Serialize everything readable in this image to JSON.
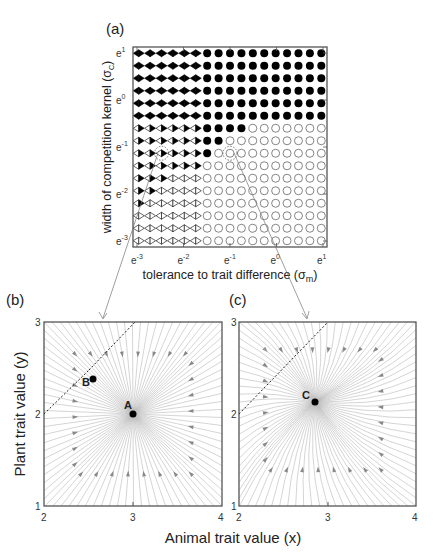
{
  "chart_data": [
    {
      "id": "a",
      "type": "scatter",
      "panel_label": "(a)",
      "title": "",
      "xlabel": "tolerance to trait difference (σm)",
      "xlabel_main": "tolerance to trait difference (σ",
      "xlabel_sub": "m",
      "xlabel_close": ")",
      "ylabel_main": "width of competition kernel (σ",
      "ylabel_sub": "C",
      "ylabel_close": ")",
      "x_scale": "log (base e)",
      "y_scale": "log (base e)",
      "x_ticks": [
        "e-3",
        "e-2",
        "e-1",
        "e0",
        "e1"
      ],
      "x_tick_exponents": [
        "-3",
        "-2",
        "-1",
        "0",
        "1"
      ],
      "y_ticks": [
        "e-3",
        "e-2",
        "e-1",
        "e0",
        "e1"
      ],
      "y_tick_exponents": [
        "-3",
        "-2",
        "-1",
        "0",
        "1"
      ],
      "xlim": [
        "e^-3",
        "e^1"
      ],
      "ylim": [
        "e^-3",
        "e^1"
      ],
      "grid": false,
      "n_cols": 17,
      "n_rows": 16,
      "legend": "marker type encodes stability regime: filled circle = single stable equilibrium (mutualistic coevolution), open circle = stable equilibrium, filled diamond / half-filled diamonds = bistable / alternative states",
      "marker_rows_top_to_bottom": [
        "DDDDDDFFFFFFFFFFF",
        "DDDDDDFFFFFFFFFFF",
        "DDDDDDFFFFFFFFFFF",
        "DDDDDDFFFFFFFFFFF",
        "DDDDDDFFFFFFFFFFF",
        "DDDDDDFFFFFFFFFFF",
        "HHHHHHFFFFOOOOOOO",
        "HHHHHHFFOOOOOOOOO",
        "HHHHHHFOOOOOOOOOO",
        "HHHHHHOOOOOOOOOOO",
        "HHHPPPOOOOOOOOOOO",
        "HHPPPPOOOOOOOOOOO",
        "HPPPPPOOOOOOOOOOO",
        "PPPPPPOOOOOOOOOOO",
        "PPPPPPOOOOOOOOOOO",
        "PPPPPPOOOOOOOOOOO"
      ],
      "marker_codes": {
        "D": "filled diamond (two filled triangles)",
        "H": "open-left / filled-right triangle pair",
        "P": "open diamond (two open triangles)",
        "F": "filled circle",
        "O": "open circle"
      },
      "highlighted_points": [
        {
          "label": "b",
          "col": 3,
          "row": 9
        },
        {
          "label": "c",
          "col": 9,
          "row": 9
        }
      ]
    },
    {
      "id": "b",
      "type": "streamplot",
      "panel_label": "(b)",
      "xlabel": "Animal trait value (x)",
      "ylabel": "Plant trait value (y)",
      "x_ticks": [
        "2",
        "3",
        "4"
      ],
      "y_ticks": [
        "1",
        "2",
        "3"
      ],
      "xlim": [
        2,
        4
      ],
      "ylim": [
        1,
        3
      ],
      "points": [
        {
          "label": "A",
          "x": 3.0,
          "y": 2.0,
          "kind": "stable node"
        },
        {
          "label": "B",
          "x": 2.55,
          "y": 2.4,
          "kind": "equilibrium"
        }
      ],
      "dashed_line": {
        "from": [
          2.0,
          2.0
        ],
        "to": [
          3.0,
          3.0
        ]
      }
    },
    {
      "id": "c",
      "type": "streamplot",
      "panel_label": "(c)",
      "xlabel": "Animal trait value (x)",
      "ylabel": "Plant trait value (y)",
      "x_ticks": [
        "2",
        "3",
        "4"
      ],
      "y_ticks": [
        "1",
        "2",
        "3"
      ],
      "xlim": [
        2,
        4
      ],
      "ylim": [
        1,
        3
      ],
      "points": [
        {
          "label": "C",
          "x": 2.85,
          "y": 2.05,
          "kind": "stable node"
        }
      ],
      "dashed_line": {
        "from": [
          2.0,
          2.0
        ],
        "to": [
          3.0,
          3.0
        ]
      }
    }
  ],
  "shared": {
    "xlabel": "Animal trait value (x)",
    "ylabel": "Plant trait value (y)"
  }
}
